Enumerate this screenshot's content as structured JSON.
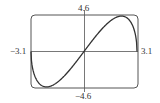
{
  "chart_data": {
    "type": "line",
    "title": "",
    "xlabel": "",
    "ylabel": "",
    "xlim": [
      -3.1,
      3.1
    ],
    "ylim": [
      -4.6,
      4.6
    ],
    "grid": false,
    "legend": null,
    "tick_labels": {
      "x_min": "−3.1",
      "x_max": "3.1",
      "y_max": "4.6",
      "y_min": "−4.6"
    },
    "series": [
      {
        "name": "f(x)",
        "x": [
          -3.1,
          -3.0,
          -2.8,
          -2.6,
          -2.4,
          -2.19,
          -2.0,
          -1.6,
          -1.2,
          -0.8,
          -0.4,
          0,
          0.4,
          0.8,
          1.2,
          1.6,
          2.0,
          2.19,
          2.4,
          2.6,
          2.8,
          3.0,
          3.1
        ],
        "y": [
          0,
          -2.34,
          -3.72,
          -4.39,
          -4.71,
          -4.6,
          -4.74,
          -4.25,
          -3.43,
          -2.4,
          -1.23,
          0,
          1.23,
          2.4,
          3.43,
          4.25,
          4.74,
          4.6,
          4.71,
          4.39,
          3.72,
          2.34,
          0
        ]
      }
    ]
  },
  "labels": {
    "y_top": "4.6",
    "y_bottom": "−4.6",
    "x_left": "−3.1",
    "x_right": "3.1"
  },
  "colors": {
    "frame": "#555555",
    "axes": "#555555",
    "curve": "#333333"
  }
}
